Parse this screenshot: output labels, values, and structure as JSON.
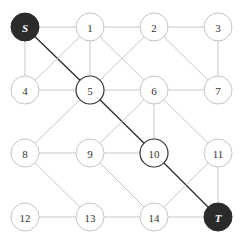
{
  "diagram": {
    "type": "graph",
    "node_radius": 14,
    "colors": {
      "edge": "#c8c8c8",
      "path_edge": "#2a2a2a",
      "node_stroke": "#c4c4c4",
      "path_node_stroke": "#333333",
      "terminal_fill": "#2b2b2b",
      "label": "#333333",
      "terminal_label": "#ffffff"
    },
    "nodes": [
      {
        "id": "S",
        "label": "S",
        "x": 25,
        "y": 27,
        "kind": "terminal"
      },
      {
        "id": "1",
        "label": "1",
        "x": 90,
        "y": 27,
        "kind": "normal"
      },
      {
        "id": "2",
        "label": "2",
        "x": 154,
        "y": 27,
        "kind": "normal"
      },
      {
        "id": "3",
        "label": "3",
        "x": 218,
        "y": 27,
        "kind": "normal"
      },
      {
        "id": "4",
        "label": "4",
        "x": 25,
        "y": 90,
        "kind": "normal"
      },
      {
        "id": "5",
        "label": "5",
        "x": 90,
        "y": 90,
        "kind": "onpath"
      },
      {
        "id": "6",
        "label": "6",
        "x": 154,
        "y": 90,
        "kind": "normal"
      },
      {
        "id": "7",
        "label": "7",
        "x": 218,
        "y": 90,
        "kind": "normal"
      },
      {
        "id": "8",
        "label": "8",
        "x": 25,
        "y": 153,
        "kind": "normal"
      },
      {
        "id": "9",
        "label": "9",
        "x": 90,
        "y": 153,
        "kind": "normal"
      },
      {
        "id": "10",
        "label": "10",
        "x": 154,
        "y": 153,
        "kind": "onpath"
      },
      {
        "id": "11",
        "label": "11",
        "x": 218,
        "y": 153,
        "kind": "normal"
      },
      {
        "id": "12",
        "label": "12",
        "x": 25,
        "y": 217,
        "kind": "normal"
      },
      {
        "id": "13",
        "label": "13",
        "x": 90,
        "y": 217,
        "kind": "normal"
      },
      {
        "id": "14",
        "label": "14",
        "x": 154,
        "y": 217,
        "kind": "normal"
      },
      {
        "id": "T",
        "label": "T",
        "x": 218,
        "y": 217,
        "kind": "terminal"
      }
    ],
    "edges": [
      {
        "from": "S",
        "to": "1",
        "path": false
      },
      {
        "from": "S",
        "to": "4",
        "path": false
      },
      {
        "from": "S",
        "to": "5",
        "path": true
      },
      {
        "from": "1",
        "to": "2",
        "path": false
      },
      {
        "from": "1",
        "to": "4",
        "path": false
      },
      {
        "from": "1",
        "to": "5",
        "path": false
      },
      {
        "from": "1",
        "to": "6",
        "path": false
      },
      {
        "from": "2",
        "to": "3",
        "path": false
      },
      {
        "from": "2",
        "to": "5",
        "path": false
      },
      {
        "from": "2",
        "to": "7",
        "path": false
      },
      {
        "from": "3",
        "to": "7",
        "path": false
      },
      {
        "from": "4",
        "to": "5",
        "path": false
      },
      {
        "from": "5",
        "to": "6",
        "path": false
      },
      {
        "from": "5",
        "to": "8",
        "path": false
      },
      {
        "from": "5",
        "to": "10",
        "path": true
      },
      {
        "from": "6",
        "to": "7",
        "path": false
      },
      {
        "from": "6",
        "to": "9",
        "path": false
      },
      {
        "from": "6",
        "to": "10",
        "path": false
      },
      {
        "from": "6",
        "to": "11",
        "path": false
      },
      {
        "from": "8",
        "to": "9",
        "path": false
      },
      {
        "from": "8",
        "to": "13",
        "path": false
      },
      {
        "from": "9",
        "to": "10",
        "path": false
      },
      {
        "from": "9",
        "to": "14",
        "path": false
      },
      {
        "from": "10",
        "to": "T",
        "path": true
      },
      {
        "from": "11",
        "to": "14",
        "path": false
      },
      {
        "from": "11",
        "to": "T",
        "path": false
      },
      {
        "from": "12",
        "to": "13",
        "path": false
      },
      {
        "from": "13",
        "to": "14",
        "path": false
      },
      {
        "from": "14",
        "to": "T",
        "path": false
      }
    ]
  }
}
